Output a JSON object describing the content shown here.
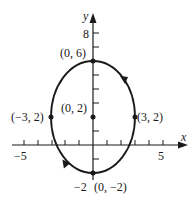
{
  "diagram": {
    "type": "parametric-ellipse",
    "direction": "clockwise",
    "axes": {
      "x_label": "x",
      "y_label": "y",
      "x_tick_labels": [
        {
          "value": -5,
          "text": "−5"
        },
        {
          "value": 5,
          "text": "5"
        }
      ],
      "y_tick_labels": [
        {
          "value": 8,
          "text": "8"
        },
        {
          "value": -2,
          "text": "−2"
        }
      ],
      "x_range": [
        -5.3,
        6.6
      ],
      "y_range": [
        -2.5,
        9.5
      ]
    },
    "ellipse": {
      "center": [
        0,
        2
      ],
      "semi_x": 3,
      "semi_y": 4
    },
    "points": [
      {
        "id": "top",
        "coords": [
          0,
          6
        ],
        "label": "(0, 6)"
      },
      {
        "id": "center",
        "coords": [
          0,
          2
        ],
        "label": "(0, 2)"
      },
      {
        "id": "left",
        "coords": [
          -3,
          2
        ],
        "label": "(−3, 2)"
      },
      {
        "id": "right",
        "coords": [
          3,
          2
        ],
        "label": "(3, 2)"
      },
      {
        "id": "bottom",
        "coords": [
          0,
          -2
        ],
        "label": "(0, −2)"
      }
    ],
    "colors": {
      "ink": "#1a1a1a",
      "background": "#ffffff"
    }
  }
}
